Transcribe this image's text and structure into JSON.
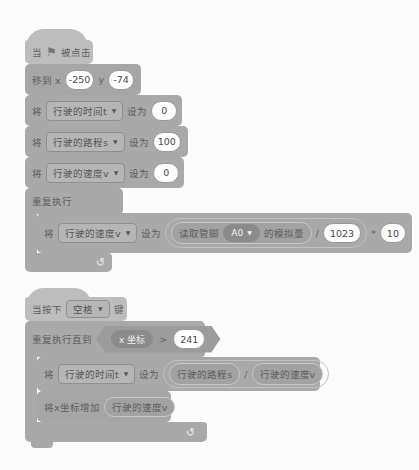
{
  "colors": {
    "hat_block": "#bdbdbd",
    "stack_block": "#a9a9a9",
    "dark_oval": "#8b8b8b",
    "white_oval": "#ffffff",
    "background": "#fcfcfc"
  },
  "icons": {
    "flag": "⚑",
    "dropdown": "▼",
    "loop": "↻"
  },
  "script1": {
    "hat": {
      "prefix": "当",
      "suffix": "被点击"
    },
    "goto": {
      "label_x": "移到 x",
      "x": "-250",
      "label_y": "y",
      "y": "-74"
    },
    "sets": [
      {
        "set": "将",
        "var": "行驶的时间t",
        "to": "设为",
        "value": "0"
      },
      {
        "set": "将",
        "var": "行驶的路程s",
        "to": "设为",
        "value": "100"
      },
      {
        "set": "将",
        "var": "行驶的速度v",
        "to": "设为",
        "value": "0"
      }
    ],
    "forever": {
      "label": "重复执行"
    },
    "set_expr": {
      "set": "将",
      "var": "行驶的速度v",
      "to": "设为",
      "read": "读取管脚",
      "pin": "A0",
      "analog": "的模拟量",
      "div": "/",
      "divisor": "1023",
      "mul": "*",
      "factor": "10"
    }
  },
  "script2": {
    "hat": {
      "prefix": "当按下",
      "key": "空格",
      "suffix": "键"
    },
    "repeat_until": {
      "label": "重复执行直到",
      "x_var": "x 坐标",
      "gt": ">",
      "value": "241"
    },
    "set_expr": {
      "set": "将",
      "var": "行驶的时间t",
      "to": "设为",
      "numerator": "行驶的路程s",
      "div": "/",
      "denominator": "行驶的速度v"
    },
    "change_x": {
      "label": "将x坐标增加",
      "var": "行驶的速度v"
    }
  }
}
